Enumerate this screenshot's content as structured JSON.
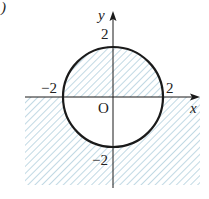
{
  "figure": {
    "corner_mark": ")",
    "axes": {
      "x_label": "x",
      "y_label": "y",
      "origin_label": "O"
    },
    "ticks": {
      "x_neg": "−2",
      "x_pos": "2",
      "y_pos": "2",
      "y_neg": "−2"
    },
    "curve": {
      "type": "circle",
      "equation": "x^2 + y^2 = 4",
      "center": [
        0,
        0
      ],
      "radius": 2
    },
    "shaded_region": {
      "description": "Inside the circle for y ≥ 0, outside the circle for y ≤ 0",
      "inequality": "(x^2 + y^2 - 4) * y ≤ 0"
    },
    "colors": {
      "hatch": "#9fc4d6",
      "stroke": "#1a1a1a",
      "background": "#ffffff"
    }
  }
}
